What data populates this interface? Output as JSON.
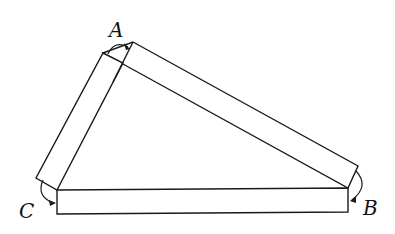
{
  "diagram": {
    "type": "three-bar triangle linkage",
    "vertices": [
      {
        "label": "A",
        "x": 117,
        "y": 30
      },
      {
        "label": "B",
        "x": 371,
        "y": 213
      },
      {
        "label": "C",
        "x": 29,
        "y": 214
      }
    ],
    "line_color": "#1a1a1a",
    "background": "#ffffff"
  }
}
